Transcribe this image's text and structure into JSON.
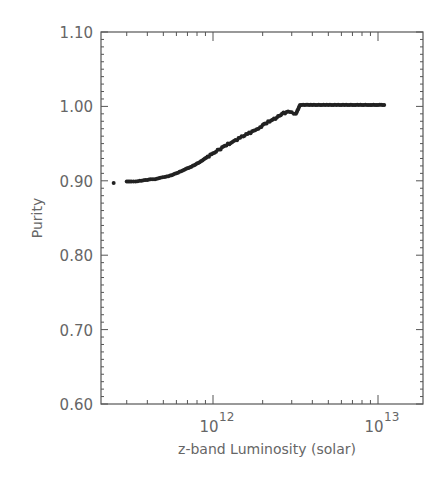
{
  "chart_data": {
    "type": "scatter",
    "title": "",
    "xlabel": "z-band Luminosity (solar)",
    "ylabel": "Purity",
    "xscale": "log",
    "xlim": [
      210000000000.0,
      18500000000000.0
    ],
    "ylim": [
      0.6,
      1.1
    ],
    "grid": false,
    "legend": null,
    "y_ticks": [
      0.6,
      0.7,
      0.8,
      0.9,
      1.0,
      1.1
    ],
    "y_tick_labels": [
      "0.60",
      "0.70",
      "0.80",
      "0.90",
      "1.00",
      "1.10"
    ],
    "x_ticks": [
      1000000000000.0,
      10000000000000.0
    ],
    "x_tick_labels": [
      {
        "base": "10",
        "exp": "12"
      },
      {
        "base": "10",
        "exp": "13"
      }
    ],
    "series": [
      {
        "name": "purity",
        "marker": "dot",
        "color": "#222222",
        "x": [
          250000000000.0,
          300000000000.0,
          320000000000.0,
          340000000000.0,
          360000000000.0,
          390000000000.0,
          420000000000.0,
          445000000000.0,
          480000000000.0,
          510000000000.0,
          550000000000.0,
          600000000000.0,
          670000000000.0,
          740000000000.0,
          830000000000.0,
          910000000000.0,
          1000000000000.0,
          1090000000000.0,
          1180000000000.0,
          1310000000000.0,
          1460000000000.0,
          1620000000000.0,
          1800000000000.0,
          1930000000000.0,
          2070000000000.0,
          2250000000000.0,
          2440000000000.0,
          2620000000000.0,
          2850000000000.0,
          3000000000000.0,
          3180000000000.0,
          3370000000000.0,
          4000000000000.0,
          5000000000000.0,
          6000000000000.0,
          7000000000000.0,
          8000000000000.0,
          9000000000000.0,
          10000000000000.0,
          10900000000000.0
        ],
        "y": [
          0.897,
          0.899,
          0.899,
          0.899,
          0.9,
          0.901,
          0.902,
          0.902,
          0.904,
          0.905,
          0.907,
          0.91,
          0.915,
          0.919,
          0.925,
          0.931,
          0.937,
          0.942,
          0.947,
          0.952,
          0.958,
          0.963,
          0.968,
          0.972,
          0.977,
          0.981,
          0.985,
          0.99,
          0.993,
          0.992,
          0.99,
          1.002,
          1.002,
          1.002,
          1.002,
          1.002,
          1.002,
          1.002,
          1.002,
          1.002
        ]
      }
    ]
  },
  "axes": {
    "ylabel": "Purity",
    "xlabel": "z-band Luminosity (solar)"
  }
}
